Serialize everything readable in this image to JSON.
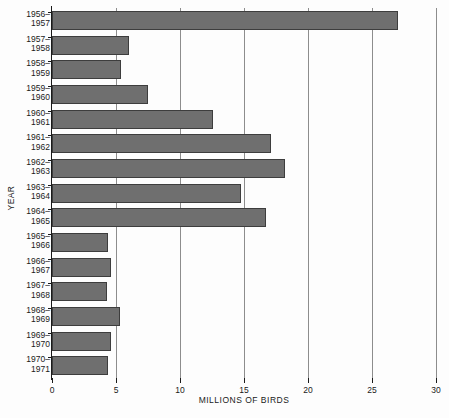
{
  "chart_data": {
    "type": "bar",
    "orientation": "horizontal",
    "title": "",
    "xlabel": "MILLIONS OF BIRDS",
    "ylabel": "YEAR",
    "xlim": [
      0,
      30
    ],
    "ylim": null,
    "grid": "vertical-gridlines-at-xticks",
    "legend": null,
    "xticks": [
      0,
      5,
      10,
      15,
      20,
      25,
      30
    ],
    "xtick_labels": [
      "0",
      "5",
      "10",
      "15",
      "20",
      "25",
      "30"
    ],
    "categories": [
      "1956–1957",
      "1957–1958",
      "1958–1959",
      "1959–1960",
      "1960–1961",
      "1961–1962",
      "1962–1963",
      "1963–1964",
      "1964–1965",
      "1965–1966",
      "1966–1967",
      "1967–1968",
      "1968–1969",
      "1969–1970",
      "1970–1971"
    ],
    "category_lines": [
      [
        "1956–",
        "1957"
      ],
      [
        "1957–",
        "1958"
      ],
      [
        "1958–",
        "1959"
      ],
      [
        "1959–",
        "1960"
      ],
      [
        "1960–",
        "1961"
      ],
      [
        "1961–",
        "1962"
      ],
      [
        "1962–",
        "1963"
      ],
      [
        "1963–",
        "1964"
      ],
      [
        "1964–",
        "1965"
      ],
      [
        "1965–",
        "1966"
      ],
      [
        "1966–",
        "1967"
      ],
      [
        "1967–",
        "1968"
      ],
      [
        "1968–",
        "1969"
      ],
      [
        "1969–",
        "1970"
      ],
      [
        "1970–",
        "1971"
      ]
    ],
    "values": [
      27.0,
      6.0,
      5.4,
      7.5,
      12.6,
      17.1,
      18.2,
      14.8,
      16.7,
      4.4,
      4.6,
      4.3,
      5.3,
      4.6,
      4.4
    ],
    "bar_color": "#6f6f6f",
    "bar_edge_color": "#3d3d3d",
    "gridline_color": "#8d8d8d",
    "axis_color": "#1a1a1a",
    "background_color": "#fdfdfd"
  }
}
